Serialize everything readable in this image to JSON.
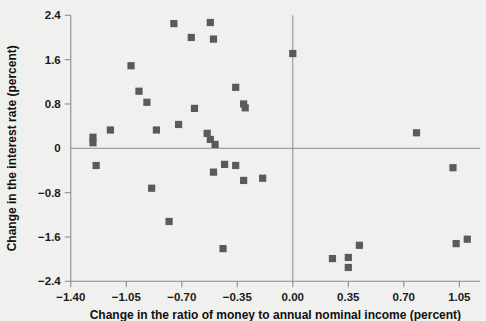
{
  "chart_data": {
    "type": "scatter",
    "title": "",
    "xlabel": "Change in the ratio of money to annual nominal income (percent)",
    "ylabel": "Change in the interest rate (percent)",
    "xlim": [
      -1.4,
      1.05
    ],
    "ylim": [
      -2.4,
      2.4
    ],
    "xticks": [
      -1.4,
      -1.05,
      -0.7,
      -0.35,
      0.0,
      0.35,
      0.7,
      1.05
    ],
    "xtick_labels": [
      "−1.40",
      "−1.05",
      "−0.70",
      "−0.35",
      "0.00",
      "0.35",
      "0.70",
      "1.05"
    ],
    "yticks": [
      2.4,
      1.6,
      0.8,
      0,
      -0.8,
      -1.6,
      -2.4
    ],
    "ytick_labels": [
      "2.4",
      "1.6",
      "0.8",
      "0",
      "−0.8",
      "−1.6",
      "−2.4"
    ],
    "grid": false,
    "legend": null,
    "marker_color": "#5a5a5a",
    "axis_color": "#8c8c8c",
    "background_color": "#f0f0ee",
    "zero_lines": {
      "x": 0.0,
      "y": 0
    },
    "points": [
      {
        "x": -1.26,
        "y": 0.2
      },
      {
        "x": -1.26,
        "y": 0.1
      },
      {
        "x": -1.24,
        "y": -0.31
      },
      {
        "x": -1.15,
        "y": 0.33
      },
      {
        "x": -1.02,
        "y": 1.49
      },
      {
        "x": -0.97,
        "y": 1.03
      },
      {
        "x": -0.92,
        "y": 0.83
      },
      {
        "x": -0.89,
        "y": -0.72
      },
      {
        "x": -0.86,
        "y": 0.33
      },
      {
        "x": -0.78,
        "y": -1.32
      },
      {
        "x": -0.75,
        "y": 2.25
      },
      {
        "x": -0.72,
        "y": 0.43
      },
      {
        "x": -0.64,
        "y": 2.0
      },
      {
        "x": -0.62,
        "y": 0.72
      },
      {
        "x": -0.52,
        "y": 2.27
      },
      {
        "x": -0.5,
        "y": 1.97
      },
      {
        "x": -0.54,
        "y": 0.27
      },
      {
        "x": -0.52,
        "y": 0.16
      },
      {
        "x": -0.49,
        "y": 0.07
      },
      {
        "x": -0.5,
        "y": -0.43
      },
      {
        "x": -0.44,
        "y": -1.81
      },
      {
        "x": -0.43,
        "y": -0.29
      },
      {
        "x": -0.36,
        "y": -0.31
      },
      {
        "x": -0.36,
        "y": 1.1
      },
      {
        "x": -0.31,
        "y": 0.8
      },
      {
        "x": -0.31,
        "y": -0.58
      },
      {
        "x": -0.3,
        "y": 0.73
      },
      {
        "x": -0.19,
        "y": -0.54
      },
      {
        "x": 0.0,
        "y": 1.71
      },
      {
        "x": 0.25,
        "y": -1.99
      },
      {
        "x": 0.35,
        "y": -1.97
      },
      {
        "x": 0.35,
        "y": -2.15
      },
      {
        "x": 0.42,
        "y": -1.75
      },
      {
        "x": 0.78,
        "y": 0.28
      },
      {
        "x": 1.01,
        "y": -0.35
      },
      {
        "x": 1.03,
        "y": -1.72
      },
      {
        "x": 1.1,
        "y": -1.64
      }
    ]
  },
  "figure": {
    "x_axis_label": "Change in the ratio of money to annual nominal income (percent)",
    "y_axis_label": "Change in the interest rate (percent)"
  }
}
